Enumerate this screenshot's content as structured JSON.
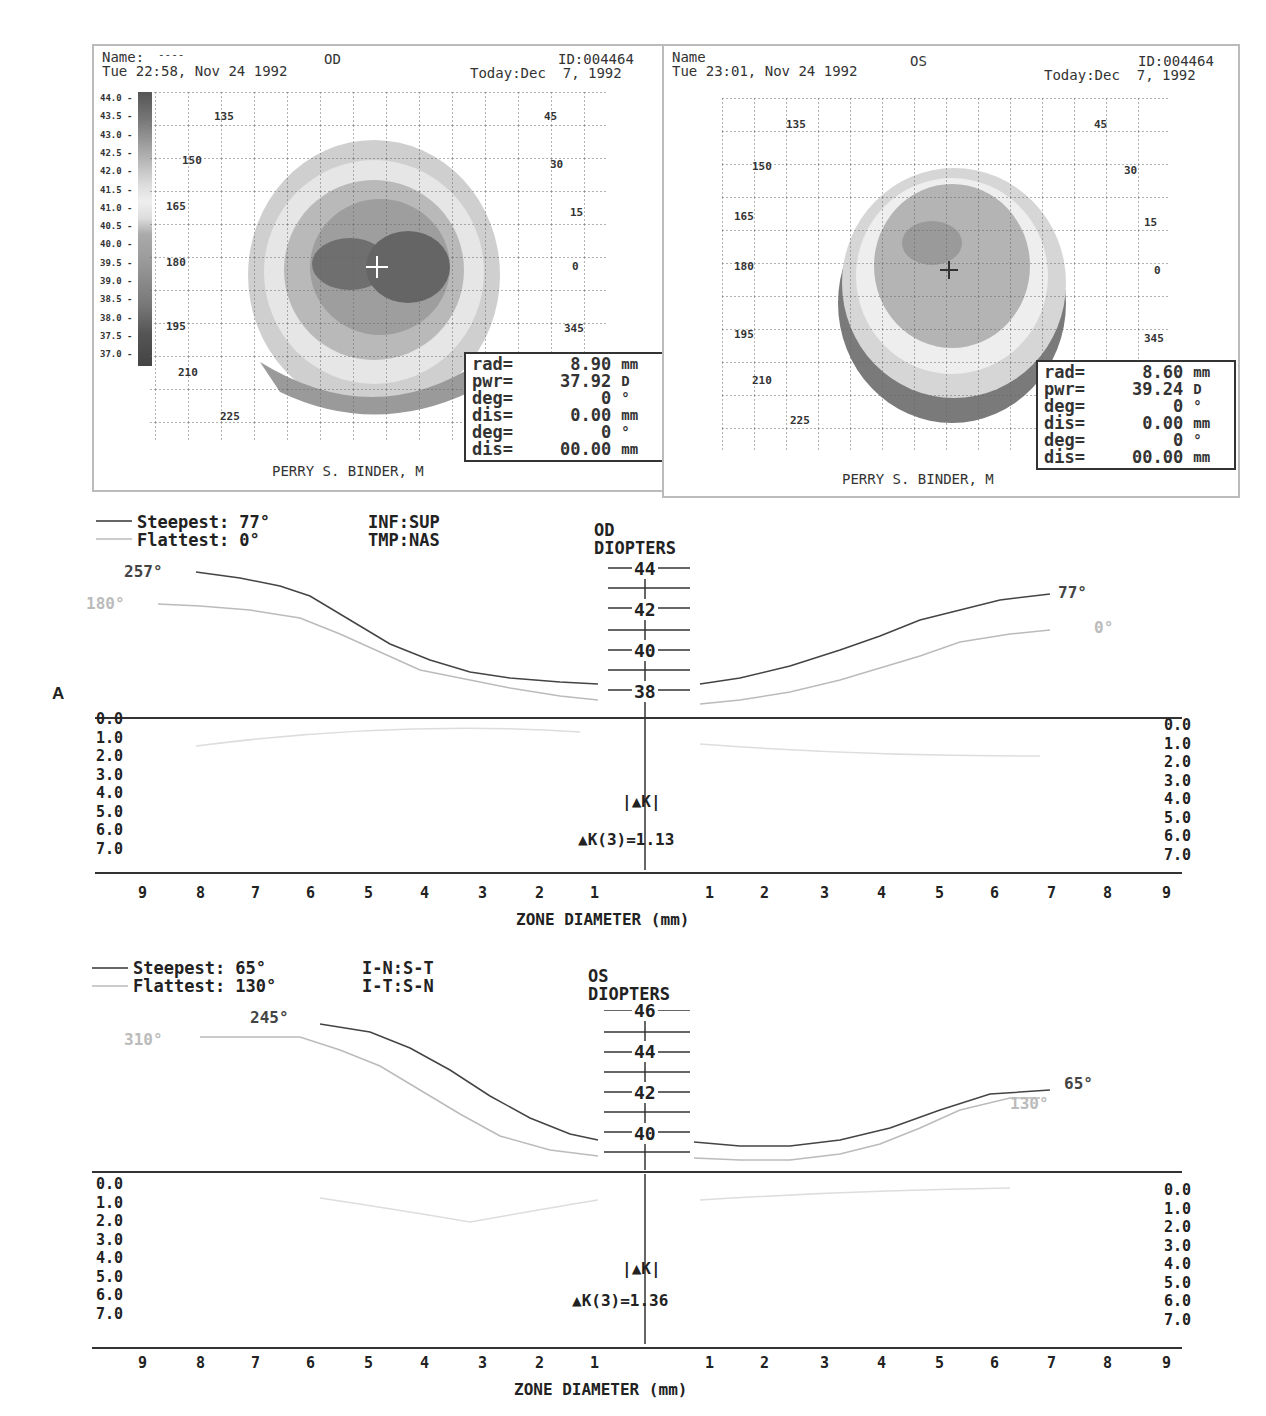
{
  "figure_label": "A",
  "topo_od": {
    "name_label": "Name:",
    "name_value": "----",
    "eye": "OD",
    "id": "ID:004464",
    "exam_datetime": "Tue 22:58, Nov 24 1992",
    "today": "Today:Dec  7, 1992",
    "footer": "PERRY S. BINDER, M",
    "scale": [
      "44.0",
      "43.5",
      "43.0",
      "42.5",
      "42.0",
      "41.5",
      "41.0",
      "40.5",
      "40.0",
      "39.5",
      "39.0",
      "38.5",
      "38.0",
      "37.5",
      "37.0"
    ],
    "angles": [
      "135",
      "45",
      "150",
      "30",
      "165",
      "15",
      "180",
      "0",
      "195",
      "345",
      "210",
      "225"
    ],
    "info": [
      {
        "k": "rad=",
        "v": "8.90",
        "u": "mm"
      },
      {
        "k": "pwr=",
        "v": "37.92",
        "u": "D"
      },
      {
        "k": "deg=",
        "v": "0",
        "u": "°"
      },
      {
        "k": "dis=",
        "v": "0.00",
        "u": "mm"
      },
      {
        "k": "deg=",
        "v": "0",
        "u": "°"
      },
      {
        "k": "dis=",
        "v": "00.00",
        "u": "mm"
      }
    ]
  },
  "topo_os": {
    "name_label": "Name",
    "eye": "OS",
    "id": "ID:004464",
    "exam_datetime": "Tue 23:01, Nov 24 1992",
    "today": "Today:Dec  7, 1992",
    "footer": "PERRY S. BINDER, M",
    "angles": [
      "135",
      "45",
      "150",
      "30",
      "165",
      "15",
      "180",
      "0",
      "195",
      "345",
      "210",
      "225"
    ],
    "info": [
      {
        "k": "rad=",
        "v": "8.60",
        "u": "mm"
      },
      {
        "k": "pwr=",
        "v": "39.24",
        "u": "D"
      },
      {
        "k": "deg=",
        "v": "0",
        "u": "°"
      },
      {
        "k": "dis=",
        "v": "0.00",
        "u": "mm"
      },
      {
        "k": "deg=",
        "v": "0",
        "u": "°"
      },
      {
        "k": "dis=",
        "v": "00.00",
        "u": "mm"
      }
    ]
  },
  "profile_od": {
    "steepest": "Steepest: 77°",
    "flattest": "Flattest: 0°",
    "orient1": "INF:SUP",
    "orient2": "TMP:NAS",
    "eye": "OD",
    "units": "DIOPTERS",
    "diopter_ticks": [
      "44",
      "42",
      "40",
      "38"
    ],
    "left_steep_label": "257°",
    "left_flat_label": "180°",
    "right_steep_label": "77°",
    "right_flat_label": "0°",
    "dk": "|▲K|",
    "dk3": "▲K(3)=1.13",
    "diff_scale": [
      "0.0",
      "1.0",
      "2.0",
      "3.0",
      "4.0",
      "5.0",
      "6.0",
      "7.0"
    ],
    "x_ticks": [
      "9",
      "8",
      "7",
      "6",
      "5",
      "4",
      "3",
      "2",
      "1",
      "1",
      "2",
      "3",
      "4",
      "5",
      "6",
      "7",
      "8",
      "9"
    ],
    "xlabel": "ZONE DIAMETER (mm)"
  },
  "profile_os": {
    "steepest": "Steepest: 65°",
    "flattest": "Flattest: 130°",
    "orient1": "I-N:S-T",
    "orient2": "I-T:S-N",
    "eye": "OS",
    "units": "DIOPTERS",
    "diopter_ticks": [
      "46",
      "44",
      "42",
      "40"
    ],
    "left_steep_label": "245°",
    "left_flat_label": "310°",
    "right_steep_label": "65°",
    "right_flat_label": "130°",
    "dk": "|▲K|",
    "dk3": "▲K(3)=1.36",
    "diff_scale": [
      "0.0",
      "1.0",
      "2.0",
      "3.0",
      "4.0",
      "5.0",
      "6.0",
      "7.0"
    ],
    "x_ticks": [
      "9",
      "8",
      "7",
      "6",
      "5",
      "4",
      "3",
      "2",
      "1",
      "1",
      "2",
      "3",
      "4",
      "5",
      "6",
      "7",
      "8",
      "9"
    ],
    "xlabel": "ZONE DIAMETER (mm)"
  },
  "colors": {
    "steep_line": "#333333",
    "flat_line": "#bbbbbb",
    "map_dark": "#555555",
    "map_light": "#dddddd"
  },
  "chart_data": [
    {
      "type": "line",
      "title": "OD DIOPTERS",
      "xlabel": "ZONE DIAMETER (mm)",
      "ylabel": "DIOPTERS",
      "x": [
        -8,
        -7,
        -6,
        -5,
        -4,
        -3,
        -2,
        -1,
        1,
        2,
        3,
        4,
        5,
        6,
        7
      ],
      "ylim": [
        37,
        45
      ],
      "series": [
        {
          "name": "Steepest 77° (257°/77°)",
          "values": [
            44.3,
            44.0,
            43.6,
            42.6,
            41.3,
            39.6,
            38.8,
            38.3,
            38.3,
            38.6,
            39.2,
            39.9,
            41.1,
            42.0,
            42.6
          ]
        },
        {
          "name": "Flattest 0° (180°/0°)",
          "values": [
            43.0,
            42.9,
            42.6,
            41.7,
            40.4,
            39.2,
            38.4,
            37.9,
            37.9,
            38.2,
            38.6,
            39.3,
            40.2,
            41.2,
            41.6
          ]
        }
      ],
      "k_diff": "▲K(3)=1.13",
      "diff_ylim": [
        0,
        7
      ]
    },
    {
      "type": "line",
      "title": "OS DIOPTERS",
      "xlabel": "ZONE DIAMETER (mm)",
      "ylabel": "DIOPTERS",
      "x": [
        -8,
        -7,
        -6,
        -5,
        -4,
        -3,
        -2,
        -1,
        1,
        2,
        3,
        4,
        5,
        6,
        7
      ],
      "ylim": [
        38,
        47
      ],
      "series": [
        {
          "name": "Steepest 65° (245°/65°)",
          "values": [
            46.0,
            46.0,
            46.0,
            45.7,
            44.6,
            43.0,
            41.4,
            40.3,
            39.9,
            39.8,
            40.0,
            40.5,
            41.3,
            42.0,
            42.4
          ]
        },
        {
          "name": "Flattest 130° (310°/130°)",
          "values": [
            45.3,
            45.3,
            45.2,
            44.4,
            43.0,
            41.2,
            40.0,
            39.5,
            39.3,
            39.3,
            39.6,
            40.3,
            41.2,
            41.9,
            41.9
          ]
        }
      ],
      "k_diff": "▲K(3)=1.36",
      "diff_ylim": [
        0,
        7
      ]
    }
  ]
}
